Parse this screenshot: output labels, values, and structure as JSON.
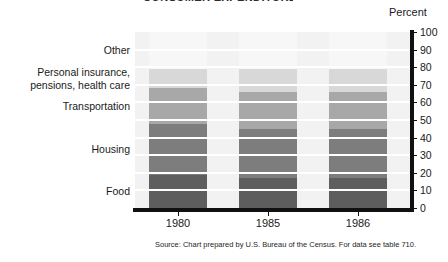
{
  "title_sliver": "CONSUMER EXPENDITURES",
  "axis": {
    "percent_caption": "Percent",
    "ticks": [
      "100",
      "90",
      "80",
      "70",
      "60",
      "50",
      "40",
      "30",
      "20",
      "10",
      "0"
    ]
  },
  "categories": [
    {
      "label": "Other",
      "color": "#f7f7f7"
    },
    {
      "label": "Personal insurance,\npensions, health care",
      "color": "#d8d8d8"
    },
    {
      "label": "Transportation",
      "color": "#a8a8a8"
    },
    {
      "label": "Housing",
      "color": "#7d7d7d"
    },
    {
      "label": "Food",
      "color": "#5e5e5e"
    }
  ],
  "source_note": "Source: Chart prepared by U.S. Bureau of the Census. For data see table 710.",
  "chart_data": {
    "type": "bar",
    "subtype": "stacked-100-percent",
    "title": "CONSUMER EXPENDITURES",
    "xlabel": "",
    "ylabel": "Percent",
    "ylim": [
      0,
      100
    ],
    "yticks": [
      0,
      10,
      20,
      30,
      40,
      50,
      60,
      70,
      80,
      90,
      100
    ],
    "grid": "horizontal-white-ribs",
    "legend": "category-labels-at-left",
    "categories": [
      "1980",
      "1985",
      "1986"
    ],
    "series": [
      {
        "name": "Food",
        "color": "#5e5e5e",
        "values": [
          19,
          17,
          17
        ]
      },
      {
        "name": "Housing",
        "color": "#7d7d7d",
        "values": [
          29,
          28,
          28
        ]
      },
      {
        "name": "Transportation",
        "color": "#a8a8a8",
        "values": [
          20,
          21,
          21
        ]
      },
      {
        "name": "Personal insurance, pensions, health care",
        "color": "#d8d8d8",
        "values": [
          11,
          13,
          13
        ]
      },
      {
        "name": "Other",
        "color": "#f7f7f7",
        "values": [
          21,
          21,
          21
        ]
      }
    ],
    "source": "Source: Chart prepared by U.S. Bureau of the Census. For data see table 710."
  }
}
